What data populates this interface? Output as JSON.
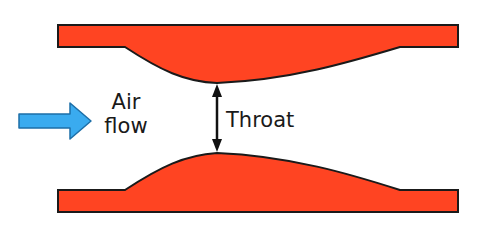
{
  "diagram": {
    "labels": {
      "air_flow_line1": "Air",
      "air_flow_line2": "flow",
      "throat": "Throat"
    },
    "colors": {
      "wall_fill": "#ff4422",
      "wall_stroke": "#1a1a1a",
      "flow_arrow_fill": "#3aabef",
      "flow_arrow_stroke": "#1d6fa8",
      "throat_arrow": "#111111",
      "text": "#1a1a1a"
    },
    "elements": [
      {
        "name": "top-wall",
        "type": "shape"
      },
      {
        "name": "bottom-wall",
        "type": "shape"
      },
      {
        "name": "air-flow-arrow",
        "type": "arrow",
        "direction": "right"
      },
      {
        "name": "throat-dimension-arrow",
        "type": "double-arrow",
        "direction": "vertical"
      }
    ]
  }
}
